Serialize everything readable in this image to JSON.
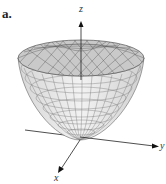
{
  "figure": {
    "panel_label": "a.",
    "axes": {
      "x_label": "x",
      "y_label": "y",
      "z_label": "z"
    },
    "surface": {
      "type": "elliptic paraboloid",
      "description": "Upward-opening bowl-shaped wireframe surface with vertex at origin"
    },
    "colors": {
      "surface_fill": "#e6e6e6",
      "surface_lines": "#555555",
      "axes": "#222222"
    }
  }
}
